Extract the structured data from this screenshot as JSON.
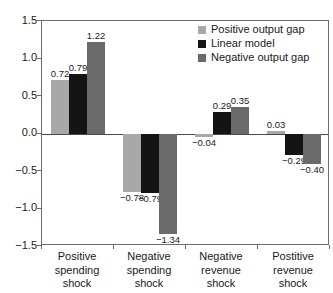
{
  "chart_data": {
    "type": "bar",
    "title": "",
    "subtitle": "",
    "xlabel": "",
    "ylabel": "",
    "ylim": [
      -1.5,
      1.5
    ],
    "grid": false,
    "legend_position": "top-right",
    "yticks": [
      "1.5",
      "1.0",
      "0.5",
      "0.0",
      "-0.5",
      "-1.0",
      "-1.5"
    ],
    "ytick_values": [
      1.5,
      1.0,
      0.5,
      0.0,
      -0.5,
      -1.0,
      -1.5
    ],
    "categories": [
      "Positive spending shock",
      "Negative spending shock",
      "Negative revenue shock",
      "Postitive revenue shock"
    ],
    "category_lines": [
      [
        "Positive",
        "spending",
        "shock"
      ],
      [
        "Negative",
        "spending",
        "shock"
      ],
      [
        "Negative",
        "revenue",
        "shock"
      ],
      [
        "Postitive",
        "revenue",
        "shock"
      ]
    ],
    "series": [
      {
        "name": "Positive output gap",
        "color": "#a8a8a8",
        "values": [
          0.72,
          -0.78,
          -0.04,
          0.03
        ],
        "labels": [
          "0.72",
          "−0.78",
          "−0.04",
          "0.03"
        ]
      },
      {
        "name": "Linear model",
        "color": "#141414",
        "values": [
          0.79,
          -0.79,
          0.29,
          -0.29
        ],
        "labels": [
          "0.79",
          "−0.79",
          "0.29",
          "−0.29"
        ]
      },
      {
        "name": "Negative output gap",
        "color": "#6b6b6b",
        "values": [
          1.22,
          -1.34,
          0.35,
          -0.4
        ],
        "labels": [
          "1.22",
          "−1.34",
          "0.35",
          "−0.40"
        ]
      }
    ]
  },
  "legend": {
    "items": [
      {
        "label": "Positive output gap",
        "color": "#a8a8a8"
      },
      {
        "label": "Linear model",
        "color": "#141414"
      },
      {
        "label": "Negative output gap",
        "color": "#6b6b6b"
      }
    ]
  },
  "axis": {
    "frame_color": "#6d6d6d",
    "zero_line_color": "#4a4a4a"
  }
}
